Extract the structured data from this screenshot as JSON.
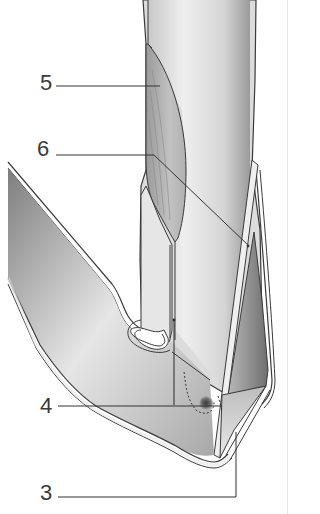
{
  "diagram": {
    "colors": {
      "background": "#ffffff",
      "outline": "#3a3a3a",
      "wall_fill": "#dcdcdc",
      "lumen_light": "#f0f0f0",
      "lumen_dark": "#8a8a8a",
      "muscle_fill": "#a8a8a8",
      "leader_line": "#333333"
    },
    "labels": [
      {
        "id": "5",
        "text": "5",
        "x": 40,
        "y": 72
      },
      {
        "id": "6",
        "text": "6",
        "x": 37,
        "y": 138
      },
      {
        "id": "4",
        "text": "4",
        "x": 40,
        "y": 395
      },
      {
        "id": "3",
        "text": "3",
        "x": 40,
        "y": 482
      }
    ]
  }
}
